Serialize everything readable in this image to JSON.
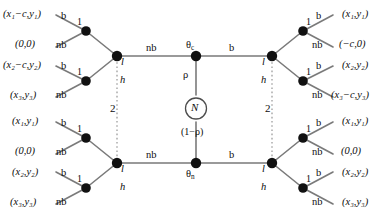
{
  "diagram": {
    "type": "extensive-form-game-tree",
    "colors": {
      "line": "#7a7a7a",
      "node": "#111111",
      "text": "#0d0d0d",
      "dotted": "#999999",
      "background": "#ffffff"
    },
    "nature": {
      "label": "N",
      "upper_branch_prob": "ρ",
      "lower_branch_prob": "(1−ρ)",
      "upper_type": "θ",
      "upper_type_sub": "c",
      "lower_type": "θ",
      "lower_type_sub": "n"
    },
    "information_sets": {
      "left_label": "2",
      "right_label": "2"
    },
    "player_labels": {
      "sender": "1",
      "receiver": "2"
    },
    "messages": {
      "left": "nb",
      "right": "b"
    },
    "responses": {
      "high": "h",
      "low": "l"
    },
    "actions": {
      "accept": "b",
      "reject": "nb"
    },
    "branches": [
      {
        "id": "top-left",
        "side": "left",
        "row": "top",
        "response": "l",
        "player": "1",
        "leaves": [
          {
            "action": "b",
            "payoff_open": "(",
            "payoff": "x",
            "payoff_sub": "1",
            "payoff_mid": "−c,y",
            "payoff_sub2": "1",
            "payoff_close": ")",
            "text": "(x₁−c,y₁)"
          },
          {
            "action": "nb",
            "text": "(0,0)",
            "plain": true
          }
        ]
      },
      {
        "id": "top-left-2",
        "side": "left",
        "row": "top",
        "response": "h",
        "player": "1",
        "leaves": [
          {
            "action": "b",
            "text": "(x₂−c,y₂)"
          },
          {
            "action": "nb",
            "text": "(x₃,y₃)"
          }
        ]
      },
      {
        "id": "top-right",
        "side": "right",
        "row": "top",
        "response": "l",
        "player": "1",
        "leaves": [
          {
            "action": "b",
            "text": "(x₁,y₁)"
          },
          {
            "action": "nb",
            "text": "(−c,0)",
            "plain": true
          }
        ]
      },
      {
        "id": "top-right-2",
        "side": "right",
        "row": "top",
        "response": "h",
        "player": "1",
        "leaves": [
          {
            "action": "b",
            "text": "(x₂,y₂)"
          },
          {
            "action": "nb",
            "text": "(x₃−c,y₃)"
          }
        ]
      },
      {
        "id": "bottom-left",
        "side": "left",
        "row": "bottom",
        "response": "l",
        "player": "1",
        "leaves": [
          {
            "action": "b",
            "text": "(x₁,y₁)"
          },
          {
            "action": "nb",
            "text": "(0,0)",
            "plain": true
          }
        ]
      },
      {
        "id": "bottom-left-2",
        "side": "left",
        "row": "bottom",
        "response": "h",
        "player": "1",
        "leaves": [
          {
            "action": "b",
            "text": "(x₂,y₂)"
          },
          {
            "action": "nb",
            "text": "(x₃,y₃)"
          }
        ]
      },
      {
        "id": "bottom-right",
        "side": "right",
        "row": "bottom",
        "response": "l",
        "player": "1",
        "leaves": [
          {
            "action": "b",
            "text": "(x₁,y₁)"
          },
          {
            "action": "nb",
            "text": "(0,0)",
            "plain": true
          }
        ]
      },
      {
        "id": "bottom-right-2",
        "side": "right",
        "row": "bottom",
        "response": "h",
        "player": "1",
        "leaves": [
          {
            "action": "b",
            "text": "(x₂,y₂)"
          },
          {
            "action": "nb",
            "text": "(x₃,y₃)"
          }
        ]
      }
    ]
  },
  "labels": {
    "edge_nb_top_left": "nb",
    "edge_b_top_right": "b",
    "edge_nb_bottom_left": "nb",
    "edge_b_bottom_right": "b",
    "rho": "ρ",
    "one_minus_rho": "(1−ρ)",
    "nature_node": "N",
    "theta_c_base": "θ",
    "theta_c_sub": "c",
    "theta_n_base": "θ",
    "theta_n_sub": "n",
    "infoset_left": "2",
    "infoset_right": "2",
    "p1_tl": "1",
    "p1_tl2": "1",
    "p1_tr": "1",
    "p1_tr2": "1",
    "p1_bl": "1",
    "p1_bl2": "1",
    "p1_br": "1",
    "p1_br2": "1",
    "l_tl": "l",
    "h_tl": "h",
    "l_tr": "l",
    "h_tr": "h",
    "l_bl": "l",
    "h_bl": "h",
    "l_br": "l",
    "h_br": "h",
    "b_tl1": "b",
    "nb_tl1": "nb",
    "b_tl2": "b",
    "nb_tl2": "nb",
    "b_tr1": "b",
    "nb_tr1": "nb",
    "b_tr2": "b",
    "nb_tr2": "nb",
    "b_bl1": "b",
    "nb_bl1": "nb",
    "b_bl2": "b",
    "nb_bl2": "nb",
    "b_br1": "b",
    "nb_br1": "nb",
    "b_br2": "b",
    "nb_br2": "nb",
    "pay_tl1": "(x₁−c,y₁)",
    "pay_tl2": "(0,0)",
    "pay_tl3": "(x₂−c,y₂)",
    "pay_tl4": "(x₃,y₃)",
    "pay_tr1": "(x₁,y₁)",
    "pay_tr2": "(−c,0)",
    "pay_tr3": "(x₂,y₂)",
    "pay_tr4": "(x₃−c,y₃)",
    "pay_bl1": "(x₁,y₁)",
    "pay_bl2": "(0,0)",
    "pay_bl3": "(x₂,y₂)",
    "pay_bl4": "(x₃,y₃)",
    "pay_br1": "(x₁,y₁)",
    "pay_br2": "(0,0)",
    "pay_br3": "(x₂,y₂)",
    "pay_br4": "(x₃,y₃)"
  }
}
